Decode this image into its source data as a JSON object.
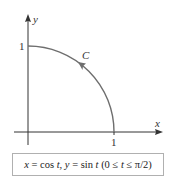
{
  "figure": {
    "axes": {
      "x_label": "x",
      "y_label": "y",
      "x_tick": "1",
      "y_tick": "1"
    },
    "curve": {
      "label": "C",
      "shape": "quarter-circle",
      "direction": "counterclockwise",
      "color": "#6e6e6e"
    },
    "formula": {
      "text": "x = cos t, y = sin t (0 ≤ t ≤ π/2)",
      "x_var": "x",
      "eq1": " = cos ",
      "t1": "t",
      "comma": ", ",
      "y_var": "y",
      "eq2": " = sin ",
      "t2": "t",
      "range_open": " (0 ≤ ",
      "t3": "t",
      "range_close": " ≤ π/2)"
    },
    "colors": {
      "axis": "#333333",
      "curve": "#6e6e6e",
      "box_border": "#b0b0b0"
    }
  }
}
